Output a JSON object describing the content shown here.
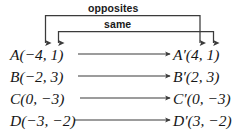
{
  "diagram": {
    "type": "reflection-mapping-diagram",
    "brackets": [
      {
        "id": "opposites",
        "label": "opposites",
        "targets": [
          "source-x",
          "image-x"
        ]
      },
      {
        "id": "same",
        "label": "same",
        "targets": [
          "source-y",
          "image-y"
        ]
      }
    ],
    "rows": [
      {
        "source": {
          "name": "A",
          "x": "−4",
          "y": "1",
          "text": "A(−4, 1)"
        },
        "image": {
          "name": "A′",
          "x": "4",
          "y": "1",
          "text": "A′(4, 1)"
        }
      },
      {
        "source": {
          "name": "B",
          "x": "−2",
          "y": "3",
          "text": "B(−2, 3)"
        },
        "image": {
          "name": "B′",
          "x": "2",
          "y": "3",
          "text": "B′(2, 3)"
        }
      },
      {
        "source": {
          "name": "C",
          "x": "0",
          "y": "−3",
          "text": "C(0, −3)"
        },
        "image": {
          "name": "C′",
          "x": "0",
          "y": "−3",
          "text": "C′(0, −3)"
        }
      },
      {
        "source": {
          "name": "D",
          "x": "−3",
          "y": "−2",
          "text": "D(−3, −2)"
        },
        "image": {
          "name": "D′",
          "x": "3",
          "y": "−2",
          "text": "D′(3, −2)"
        }
      }
    ],
    "colors": {
      "ink": "#1a1a1a",
      "line": "#3b3b3b",
      "background": "#ffffff"
    }
  }
}
